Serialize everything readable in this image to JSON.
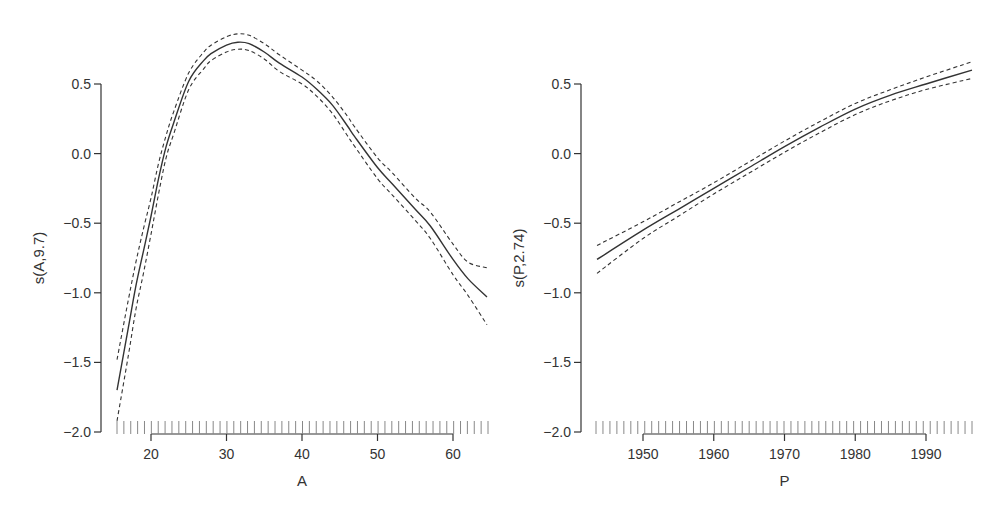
{
  "chart_data": [
    {
      "type": "line",
      "title": "",
      "xlabel": "A",
      "ylabel": "s(A,9.7)",
      "xlim": [
        15.5,
        64.5
      ],
      "ylim": [
        -2.0,
        0.85
      ],
      "x_ticks": [
        20,
        30,
        40,
        50,
        60
      ],
      "y_ticks": [
        0.5,
        0.0,
        -0.5,
        -1.0,
        -1.5,
        -2.0
      ],
      "x_tick_labels": [
        "20",
        "30",
        "40",
        "50",
        "60"
      ],
      "y_tick_labels": [
        "0.5",
        "0.0",
        "-0.5",
        "-1.0",
        "-1.5",
        "-2.0"
      ],
      "grid": false,
      "legend": null,
      "rug": true,
      "x": [
        15.5,
        17,
        18,
        19,
        20,
        21,
        22,
        23,
        25,
        27,
        28,
        30,
        31.5,
        33,
        35,
        37,
        40,
        42,
        44,
        46,
        47,
        50,
        52,
        55,
        57,
        60,
        62,
        64.5
      ],
      "series": [
        {
          "name": "fit",
          "style": "solid",
          "values": [
            -1.7,
            -1.25,
            -0.95,
            -0.7,
            -0.45,
            -0.18,
            0.05,
            0.22,
            0.52,
            0.67,
            0.72,
            0.78,
            0.8,
            0.79,
            0.73,
            0.65,
            0.55,
            0.46,
            0.35,
            0.2,
            0.12,
            -0.1,
            -0.22,
            -0.4,
            -0.52,
            -0.76,
            -0.9,
            -1.03
          ]
        },
        {
          "name": "upper 2SE",
          "style": "dashed",
          "values": [
            -1.48,
            -1.05,
            -0.78,
            -0.54,
            -0.32,
            -0.07,
            0.13,
            0.3,
            0.58,
            0.73,
            0.78,
            0.84,
            0.86,
            0.85,
            0.79,
            0.71,
            0.6,
            0.52,
            0.41,
            0.27,
            0.19,
            -0.03,
            -0.14,
            -0.32,
            -0.42,
            -0.65,
            -0.78,
            -0.82
          ]
        },
        {
          "name": "lower 2SE",
          "style": "dashed",
          "values": [
            -1.92,
            -1.45,
            -1.12,
            -0.86,
            -0.58,
            -0.29,
            -0.03,
            0.14,
            0.46,
            0.61,
            0.67,
            0.73,
            0.75,
            0.74,
            0.68,
            0.59,
            0.5,
            0.41,
            0.29,
            0.13,
            0.05,
            -0.18,
            -0.3,
            -0.48,
            -0.61,
            -0.87,
            -1.02,
            -1.23
          ]
        }
      ],
      "rug_ticks": 55
    },
    {
      "type": "line",
      "title": "",
      "xlabel": "P",
      "ylabel": "s(P,2.74)",
      "xlim": [
        1943.5,
        1996.5
      ],
      "ylim": [
        -2.0,
        0.85
      ],
      "x_ticks": [
        1950,
        1960,
        1970,
        1980,
        1990
      ],
      "y_ticks": [
        0.5,
        0.0,
        -0.5,
        -1.0,
        -1.5,
        -2.0
      ],
      "x_tick_labels": [
        "1950",
        "1960",
        "1970",
        "1980",
        "1990"
      ],
      "y_tick_labels": [
        "0.5",
        "0.0",
        "-0.5",
        "-1.0",
        "-1.5",
        "-2.0"
      ],
      "grid": false,
      "legend": null,
      "rug": true,
      "x": [
        1943.5,
        1950,
        1955,
        1960,
        1965,
        1970,
        1975,
        1980,
        1985,
        1990,
        1996.5
      ],
      "series": [
        {
          "name": "fit",
          "style": "solid",
          "values": [
            -0.76,
            -0.55,
            -0.4,
            -0.25,
            -0.1,
            0.05,
            0.19,
            0.32,
            0.42,
            0.5,
            0.6
          ]
        },
        {
          "name": "upper 2SE",
          "style": "dashed",
          "values": [
            -0.66,
            -0.49,
            -0.35,
            -0.21,
            -0.06,
            0.09,
            0.23,
            0.36,
            0.46,
            0.55,
            0.66
          ]
        },
        {
          "name": "lower 2SE",
          "style": "dashed",
          "values": [
            -0.86,
            -0.61,
            -0.45,
            -0.29,
            -0.14,
            0.01,
            0.15,
            0.28,
            0.38,
            0.46,
            0.54
          ]
        }
      ],
      "rug_ticks": 55
    }
  ],
  "colors": {
    "line": "#333333",
    "axis": "#333333",
    "rug": "#888888",
    "background": "#ffffff"
  }
}
